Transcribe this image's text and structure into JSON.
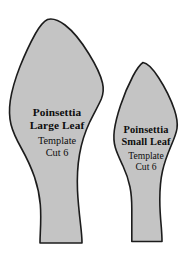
{
  "page": {
    "background_color": "#ffffff",
    "width": 188,
    "height": 255
  },
  "style": {
    "leaf_fill_color": "#c4c4c4",
    "leaf_outline_color": "#1c1c1c",
    "text_color": "#0d0d0d"
  },
  "templates": [
    {
      "id": "poinsettia-large-leaf",
      "name_line_1": "Poinsettia",
      "name_line_2": "Large Leaf",
      "type_label": "Template",
      "cut_label": "Cut 6",
      "outline_path": "M 47.5 19.5 C 43.5 21.5 39.5 26.5 35.5 33.5 C 30.5 42.5 25.0 54.0 20.0 66.5 C 15.5 78.0 12.0 89.5 10.3 100.5 C 9.0 109.5 9.3 117.5 11.0 124.5 C 13.0 132.5 17.0 140.5 21.5 148.5 C 26.5 157.5 31.0 167.0 34.5 177.0 C 37.5 186.0 39.5 195.0 40.3 204.5 C 41.0 213.0 40.8 223.0 40.3 233.0 C 40.1 237.0 40.0 240.5 40.0 243.0 L 82.0 243.0 C 82.0 239.0 81.5 232.5 80.5 224.0 C 79.3 213.5 78.0 202.0 77.5 190.5 C 77.0 178.0 77.5 166.0 79.5 154.5 C 81.5 143.0 85.0 132.0 89.5 122.5 C 94.0 113.0 98.5 105.5 101.3 99.0 C 103.5 93.5 103.8 88.5 102.5 83.0 C 100.5 74.5 95.5 64.5 89.0 54.0 C 82.0 42.5 73.5 31.5 65.0 25.0 C 59.0 20.5 53.0 18.0 47.5 19.5 Z"
    },
    {
      "id": "poinsettia-small-leaf",
      "name_line_1": "Poinsettia",
      "name_line_2": "Small Leaf",
      "type_label": "Template",
      "cut_label": "Cut 6",
      "outline_path": "M 143.0 62.5 C 140.0 64.5 136.5 69.5 133.0 76.0 C 128.5 84.5 124.0 95.0 120.5 105.5 C 117.5 114.5 115.3 123.0 114.3 130.5 C 113.5 137.0 113.8 142.5 115.3 147.5 C 117.0 153.5 120.0 159.5 123.0 166.0 C 126.0 172.5 128.5 179.5 130.0 187.0 C 131.3 193.5 131.8 200.5 131.8 208.5 C 131.8 217.5 131.8 228.0 131.8 235.5 C 131.8 238.0 131.8 240.0 131.8 241.5 L 162.0 241.5 C 162.0 238.5 161.8 233.5 161.3 227.0 C 160.5 218.5 159.8 209.0 159.8 199.5 C 159.8 189.5 160.5 180.0 162.5 171.0 C 164.5 162.0 167.8 153.5 171.0 146.0 C 174.0 139.0 176.3 133.5 177.0 128.5 C 177.8 123.0 176.8 117.0 174.5 110.0 C 171.0 99.5 165.0 87.5 158.5 77.5 C 153.0 69.0 147.8 63.0 143.0 62.5 Z"
    }
  ]
}
